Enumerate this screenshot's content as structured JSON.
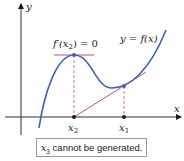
{
  "diagram": {
    "colors": {
      "curve": "#3a63b8",
      "tangent": "#c04f8f",
      "horizontal_tangent": "#d9477a",
      "dashed": "#d9477a",
      "axes": "#1a1a1a",
      "points": "#1a1a1a",
      "curve_points": "#3a63b8",
      "box_border": "#9a9a9a"
    },
    "axes": {
      "x_label": "x",
      "y_label": "y"
    },
    "curve_label": "y = f(x)",
    "derivative_label": "f′(x",
    "derivative_sub": "2",
    "derivative_rest": ") = 0",
    "points": [
      {
        "name": "x2",
        "base": "x",
        "sub": "2"
      },
      {
        "name": "x1",
        "base": "x",
        "sub": "1"
      }
    ],
    "caption": {
      "var": "x",
      "sub": "3",
      "text": " cannot be generated."
    }
  }
}
